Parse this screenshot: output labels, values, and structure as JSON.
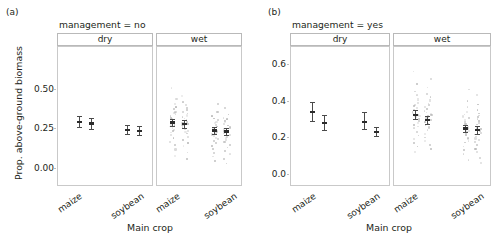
{
  "figure": {
    "type": "faceted-dotplot-with-errorbars",
    "background": "#ffffff",
    "point_color": "#9a9a9a",
    "errorbar_color": "#4a4a4a",
    "frame_color": "#c9c9c9"
  },
  "panels": [
    {
      "letter": "(a)",
      "title": "management = no",
      "ylabel": "Prop. above-ground biomass",
      "xlabel": "Main crop",
      "yticks": [
        "0.00",
        "0.25",
        "0.50"
      ],
      "ytick_values": [
        0.0,
        0.25,
        0.5
      ],
      "ylim": [
        -0.06,
        0.62
      ],
      "facets": [
        {
          "label": "dry",
          "groups": [
            "maize",
            "soybean"
          ]
        },
        {
          "label": "wet",
          "groups": [
            "maize",
            "soybean"
          ]
        }
      ]
    },
    {
      "letter": "(b)",
      "title": "management = yes",
      "ylabel": "",
      "xlabel": "Main crop",
      "yticks": [
        "0.0",
        "0.2",
        "0.4",
        "0.6"
      ],
      "ytick_values": [
        0.0,
        0.2,
        0.4,
        0.6
      ],
      "ylim": [
        -0.06,
        0.7
      ],
      "facets": [
        {
          "label": "dry",
          "groups": [
            "maize",
            "soybean"
          ]
        },
        {
          "label": "wet",
          "groups": [
            "maize",
            "soybean"
          ]
        }
      ]
    }
  ],
  "chart_data": {
    "type": "scatter",
    "xlabel": "Main crop",
    "ylabel": "Prop. above-ground biomass",
    "grid": false,
    "legend": false,
    "panels": [
      {
        "panel": "(a)",
        "title": "management = no",
        "ylim": [
          0.0,
          0.6
        ],
        "yticks": [
          0.0,
          0.25,
          0.5
        ],
        "facets": [
          {
            "facet": "dry",
            "groups": [
              {
                "crop": "maize",
                "estimates": [
                  {
                    "series": "left",
                    "mean": 0.3,
                    "lower": 0.265,
                    "upper": 0.335
                  },
                  {
                    "series": "right",
                    "mean": 0.29,
                    "lower": 0.255,
                    "upper": 0.325
                  }
                ],
                "points": []
              },
              {
                "crop": "soybean",
                "estimates": [
                  {
                    "series": "left",
                    "mean": 0.25,
                    "lower": 0.222,
                    "upper": 0.278
                  },
                  {
                    "series": "right",
                    "mean": 0.243,
                    "lower": 0.213,
                    "upper": 0.272
                  }
                ],
                "points": []
              }
            ]
          },
          {
            "facet": "wet",
            "groups": [
              {
                "crop": "maize",
                "estimates": [
                  {
                    "series": "left",
                    "mean": 0.295,
                    "lower": 0.272,
                    "upper": 0.318
                  },
                  {
                    "series": "right",
                    "mean": 0.285,
                    "lower": 0.262,
                    "upper": 0.308
                  }
                ],
                "points": [
                  0.52,
                  0.47,
                  0.45,
                  0.43,
                  0.42,
                  0.41,
                  0.4,
                  0.39,
                  0.385,
                  0.38,
                  0.37,
                  0.365,
                  0.36,
                  0.355,
                  0.35,
                  0.345,
                  0.34,
                  0.335,
                  0.33,
                  0.325,
                  0.32,
                  0.315,
                  0.31,
                  0.305,
                  0.3,
                  0.3,
                  0.295,
                  0.295,
                  0.29,
                  0.29,
                  0.285,
                  0.285,
                  0.28,
                  0.28,
                  0.275,
                  0.27,
                  0.265,
                  0.26,
                  0.255,
                  0.25,
                  0.245,
                  0.24,
                  0.235,
                  0.23,
                  0.22,
                  0.21,
                  0.2,
                  0.19,
                  0.18,
                  0.17,
                  0.16,
                  0.15,
                  0.13,
                  0.11,
                  0.09,
                  0.07
                ]
              },
              {
                "crop": "soybean",
                "estimates": [
                  {
                    "series": "left",
                    "mean": 0.245,
                    "lower": 0.222,
                    "upper": 0.268
                  },
                  {
                    "series": "right",
                    "mean": 0.238,
                    "lower": 0.215,
                    "upper": 0.261
                  }
                ],
                "points": [
                  0.42,
                  0.39,
                  0.37,
                  0.35,
                  0.34,
                  0.33,
                  0.325,
                  0.32,
                  0.315,
                  0.31,
                  0.305,
                  0.3,
                  0.295,
                  0.29,
                  0.285,
                  0.28,
                  0.275,
                  0.27,
                  0.265,
                  0.26,
                  0.255,
                  0.25,
                  0.248,
                  0.245,
                  0.243,
                  0.24,
                  0.238,
                  0.235,
                  0.232,
                  0.23,
                  0.225,
                  0.22,
                  0.215,
                  0.21,
                  0.205,
                  0.2,
                  0.195,
                  0.19,
                  0.185,
                  0.18,
                  0.17,
                  0.16,
                  0.15,
                  0.14,
                  0.13,
                  0.12,
                  0.11,
                  0.1,
                  0.085,
                  0.07,
                  0.055,
                  0.04
                ]
              }
            ]
          }
        ]
      },
      {
        "panel": "(b)",
        "title": "management = yes",
        "ylim": [
          0.0,
          0.7
        ],
        "yticks": [
          0.0,
          0.2,
          0.4,
          0.6
        ],
        "facets": [
          {
            "facet": "dry",
            "groups": [
              {
                "crop": "maize",
                "estimates": [
                  {
                    "series": "left",
                    "mean": 0.345,
                    "lower": 0.295,
                    "upper": 0.4
                  },
                  {
                    "series": "right",
                    "mean": 0.285,
                    "lower": 0.245,
                    "upper": 0.325
                  }
                ],
                "points": []
              },
              {
                "crop": "soybean",
                "estimates": [
                  {
                    "series": "left",
                    "mean": 0.29,
                    "lower": 0.25,
                    "upper": 0.345
                  },
                  {
                    "series": "right",
                    "mean": 0.235,
                    "lower": 0.212,
                    "upper": 0.262
                  }
                ],
                "points": []
              }
            ]
          },
          {
            "facet": "wet",
            "groups": [
              {
                "crop": "maize",
                "estimates": [
                  {
                    "series": "left",
                    "mean": 0.33,
                    "lower": 0.305,
                    "upper": 0.355
                  },
                  {
                    "series": "right",
                    "mean": 0.3,
                    "lower": 0.278,
                    "upper": 0.322
                  }
                ],
                "points": [
                  0.57,
                  0.53,
                  0.5,
                  0.48,
                  0.46,
                  0.45,
                  0.44,
                  0.43,
                  0.42,
                  0.415,
                  0.41,
                  0.405,
                  0.4,
                  0.395,
                  0.39,
                  0.385,
                  0.38,
                  0.375,
                  0.37,
                  0.365,
                  0.36,
                  0.355,
                  0.35,
                  0.345,
                  0.34,
                  0.338,
                  0.335,
                  0.332,
                  0.33,
                  0.328,
                  0.325,
                  0.322,
                  0.32,
                  0.315,
                  0.31,
                  0.305,
                  0.3,
                  0.295,
                  0.29,
                  0.285,
                  0.28,
                  0.275,
                  0.27,
                  0.265,
                  0.26,
                  0.25,
                  0.24,
                  0.23,
                  0.22,
                  0.21,
                  0.2,
                  0.19,
                  0.18,
                  0.17,
                  0.16,
                  0.15,
                  0.13
                ]
              },
              {
                "crop": "soybean",
                "estimates": [
                  {
                    "series": "left",
                    "mean": 0.255,
                    "lower": 0.235,
                    "upper": 0.275
                  },
                  {
                    "series": "right",
                    "mean": 0.245,
                    "lower": 0.225,
                    "upper": 0.265
                  }
                ],
                "points": [
                  0.47,
                  0.44,
                  0.41,
                  0.39,
                  0.375,
                  0.36,
                  0.35,
                  0.34,
                  0.335,
                  0.33,
                  0.325,
                  0.32,
                  0.315,
                  0.31,
                  0.305,
                  0.3,
                  0.295,
                  0.29,
                  0.285,
                  0.28,
                  0.275,
                  0.27,
                  0.265,
                  0.26,
                  0.258,
                  0.255,
                  0.252,
                  0.25,
                  0.248,
                  0.245,
                  0.24,
                  0.235,
                  0.23,
                  0.225,
                  0.22,
                  0.215,
                  0.21,
                  0.205,
                  0.2,
                  0.195,
                  0.19,
                  0.185,
                  0.18,
                  0.17,
                  0.16,
                  0.15,
                  0.14,
                  0.13,
                  0.12,
                  0.1,
                  0.085,
                  0.07
                ]
              }
            ]
          }
        ]
      }
    ]
  }
}
